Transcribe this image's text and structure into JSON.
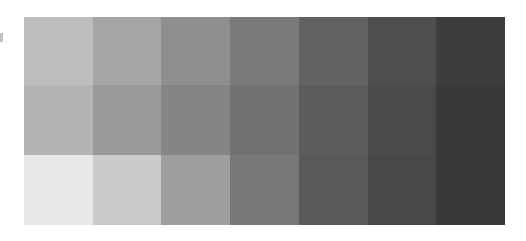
{
  "swatch_grid": {
    "rows": [
      {
        "cells": [
          "#bdbdbd",
          "#a6a6a6",
          "#8f8f8f",
          "#7a7a7a",
          "#626262",
          "#4f4f4f",
          "#3d3d3d"
        ]
      },
      {
        "cells": [
          "#b4b4b4",
          "#9a9a9a",
          "#858585",
          "#727272",
          "#5c5c5c",
          "#4a4a4a",
          "#383838"
        ]
      },
      {
        "cells": [
          "#e8e8e8",
          "#cbcbcb",
          "#9e9e9e",
          "#787878",
          "#5a5a5a",
          "#484848",
          "#383838"
        ]
      }
    ]
  }
}
